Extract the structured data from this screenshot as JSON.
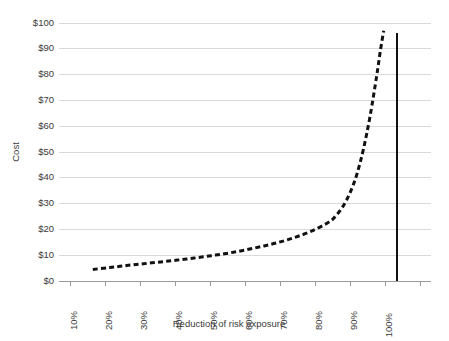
{
  "chart_data": {
    "type": "line",
    "title": "",
    "xlabel": "Reduction of risk exposure",
    "ylabel": "Cost",
    "xlim": [
      0,
      110
    ],
    "ylim": [
      0,
      100
    ],
    "grid": true,
    "legend": "none",
    "x_tick_labels": [
      "10%",
      "20%",
      "30%",
      "40%",
      "50%",
      "60%",
      "70%",
      "80%",
      "90%",
      "100%"
    ],
    "x_tick_values": [
      10,
      20,
      30,
      40,
      50,
      60,
      70,
      80,
      90,
      100
    ],
    "y_tick_labels": [
      "$0",
      "$10",
      "$20",
      "$30",
      "$40",
      "$50",
      "$60",
      "$70",
      "$80",
      "$90",
      "$100"
    ],
    "y_tick_values": [
      0,
      10,
      20,
      30,
      40,
      50,
      60,
      70,
      80,
      90,
      100
    ],
    "series": [
      {
        "name": "Cost of risk reduction",
        "style": "dashed",
        "color": "#111111",
        "x": [
          10,
          15,
          20,
          25,
          30,
          35,
          40,
          45,
          50,
          55,
          60,
          65,
          70,
          75,
          80,
          82,
          84,
          86,
          88,
          90,
          92,
          94,
          95,
          96
        ],
        "values": [
          4.5,
          5.2,
          6.0,
          6.7,
          7.4,
          8.1,
          8.9,
          9.8,
          10.8,
          12.0,
          13.4,
          15.0,
          17.0,
          19.5,
          23.0,
          25.5,
          29.0,
          34.0,
          41.0,
          51.0,
          64.0,
          80.0,
          89.0,
          97.0
        ]
      }
    ],
    "annotations": [
      {
        "name": "full-reduction-limit",
        "type": "vertical-line",
        "x": 100,
        "y_from": 0,
        "y_to": 96,
        "color": "#111111",
        "style": "solid"
      }
    ]
  },
  "axes": {
    "y_axis_title": "Cost",
    "x_axis_title": "Reduction of risk exposure"
  }
}
